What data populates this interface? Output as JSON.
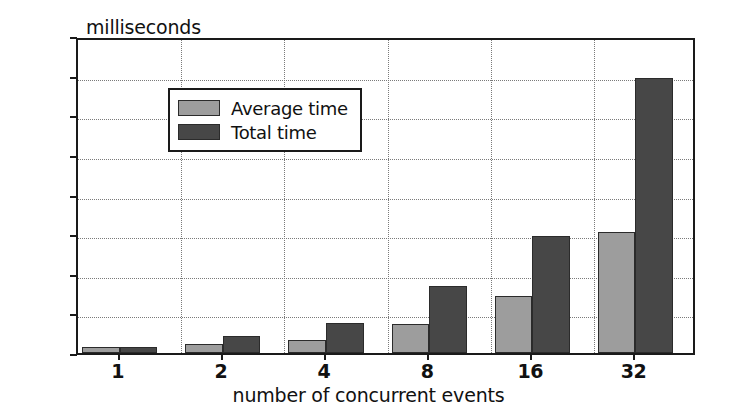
{
  "chart_data": {
    "type": "bar",
    "title": "",
    "ylabel": "milliseconds",
    "xlabel": "number of concurrent events",
    "categories": [
      "1",
      "2",
      "4",
      "8",
      "16",
      "32"
    ],
    "series": [
      {
        "name": "Average time",
        "color": "#9d9d9d",
        "values": [
          16,
          22,
          34,
          72,
          145,
          305
        ]
      },
      {
        "name": "Total time",
        "color": "#474747",
        "values": [
          16,
          44,
          75,
          170,
          295,
          695
        ]
      }
    ],
    "ylim": [
      0,
      800
    ],
    "yticks": [
      0,
      100,
      200,
      300,
      400,
      500,
      600,
      700,
      800
    ],
    "ytick_labels": [
      "0",
      "100",
      "200",
      "300",
      "400",
      "500",
      "600",
      "700",
      "800"
    ],
    "grid": true,
    "grid_style": "dotted",
    "legend_position": "upper left",
    "axis_color": "#1a1a1a",
    "background_color": "#ffffff"
  }
}
